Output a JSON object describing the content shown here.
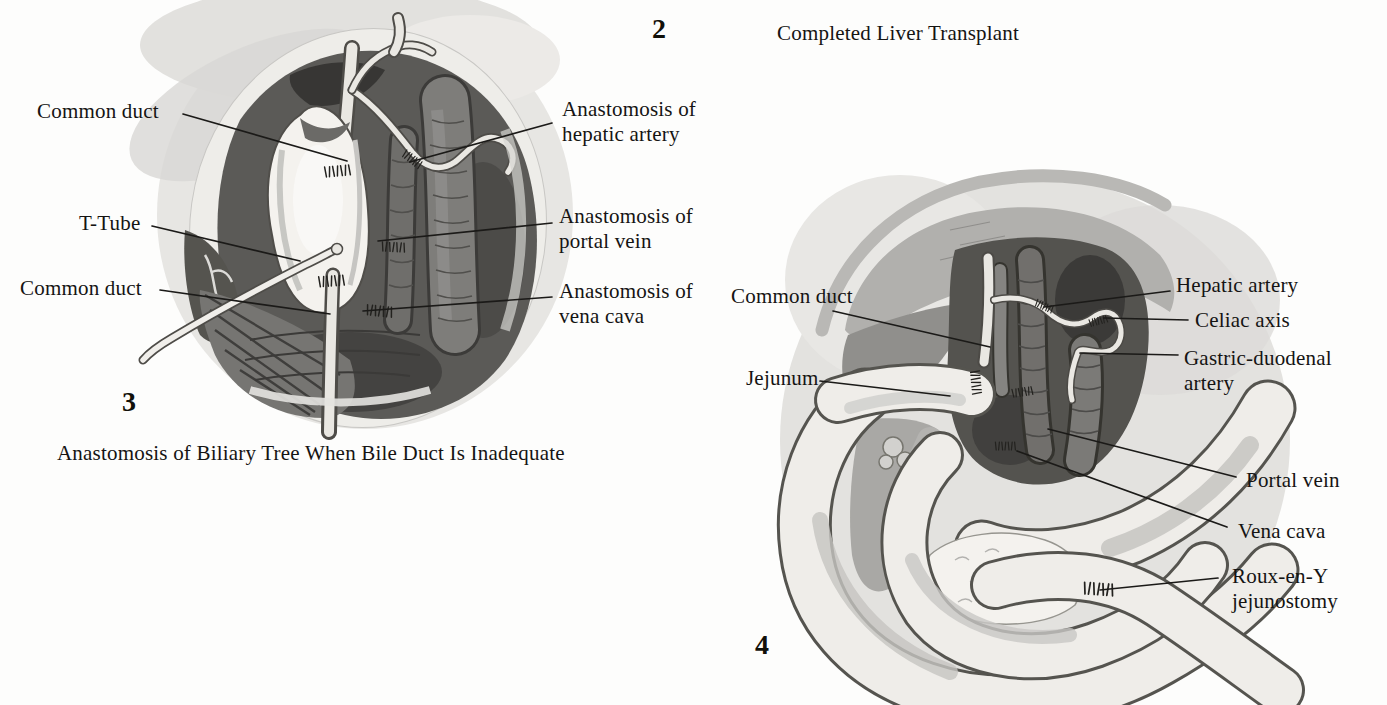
{
  "page": {
    "type": "medical-atlas-scan",
    "background": "#fdfdfc",
    "colors": {
      "text": "#151413",
      "leader_line": "#1b1a18",
      "wound_interior": "#5b5a57",
      "pale_structure": "#efede9",
      "wash": "#e5e4e1"
    }
  },
  "figure2": {
    "number": "2",
    "caption": "Completed Liver Transplant"
  },
  "figure3": {
    "number": "3",
    "caption": "Anastomosis of Biliary Tree When Bile Duct Is Inadequate",
    "labels": [
      {
        "id": "common-duct-upper",
        "text": "Common duct"
      },
      {
        "id": "t-tube",
        "text": "T-Tube"
      },
      {
        "id": "common-duct-lower",
        "text": "Common duct"
      },
      {
        "id": "anastomosis-hepatic-artery",
        "text": "Anastomosis of\nhepatic artery"
      },
      {
        "id": "anastomosis-portal-vein",
        "text": "Anastomosis of\nportal vein"
      },
      {
        "id": "anastomosis-vena-cava",
        "text": "Anastomosis of\nvena cava"
      }
    ]
  },
  "figure4": {
    "number": "4",
    "labels": [
      {
        "id": "common-duct",
        "text": "Common duct"
      },
      {
        "id": "jejunum",
        "text": "Jejunum"
      },
      {
        "id": "hepatic-artery",
        "text": "Hepatic artery"
      },
      {
        "id": "celiac-axis",
        "text": "Celiac axis"
      },
      {
        "id": "gastric-duodenal-artery",
        "text": "Gastric-duodenal\nartery"
      },
      {
        "id": "portal-vein",
        "text": "Portal vein"
      },
      {
        "id": "vena-cava",
        "text": "Vena cava"
      },
      {
        "id": "roux-en-y-jejunostomy",
        "text": "Roux-en-Y\njejunostomy"
      }
    ]
  }
}
